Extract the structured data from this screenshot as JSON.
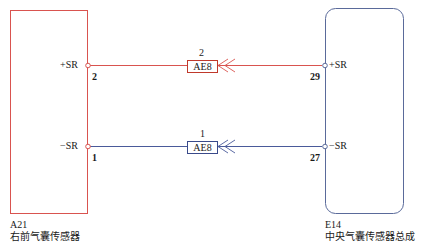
{
  "colors": {
    "red_wire": "#d9534f",
    "blue_wire": "#4a5a9a",
    "left_box": "#d9534f",
    "right_box": "#5a6a9a"
  },
  "components": {
    "left": {
      "id": "A21",
      "name": "右前气囊传感器",
      "pins": [
        {
          "signal": "+SR",
          "number": "2"
        },
        {
          "signal": "−SR",
          "number": "1"
        }
      ]
    },
    "right": {
      "id": "E14",
      "name": "中央气囊传感器总成",
      "pins": [
        {
          "signal": "+SR",
          "number": "29"
        },
        {
          "signal": "−SR",
          "number": "27"
        }
      ]
    }
  },
  "connectors": [
    {
      "label": "AE8",
      "pin": "2",
      "wire": "red"
    },
    {
      "label": "AE8",
      "pin": "1",
      "wire": "blue"
    }
  ]
}
